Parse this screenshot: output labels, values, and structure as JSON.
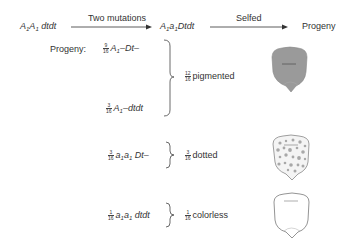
{
  "header": {
    "parent_genotype": "A1A1 dtdt",
    "step1_label": "Two mutations",
    "intermediate_genotype": "A1a1 Dtdt",
    "step2_label": "Selfed",
    "result_label": "Progeny"
  },
  "progeny_label": "Progeny:",
  "genotypes": [
    {
      "fraction_num": "9",
      "fraction_den": "16",
      "genotype": "A1–Dt–"
    },
    {
      "fraction_num": "3",
      "fraction_den": "16",
      "genotype": "A1–dtdt"
    },
    {
      "fraction_num": "3",
      "fraction_den": "16",
      "genotype": "a1a1 Dt–"
    },
    {
      "fraction_num": "1",
      "fraction_den": "16",
      "genotype": "a1a1 dtdt"
    }
  ],
  "phenotypes": [
    {
      "fraction_num": "12",
      "fraction_den": "16",
      "label": "pigmented",
      "kernel": "pigmented-kernel",
      "color": "#9a9a9a"
    },
    {
      "fraction_num": "3",
      "fraction_den": "16",
      "label": "dotted",
      "kernel": "dotted-kernel",
      "color": "#a8a8a8"
    },
    {
      "fraction_num": "1",
      "fraction_den": "16",
      "label": "colorless",
      "kernel": "colorless-kernel",
      "color": "#ffffff"
    }
  ]
}
